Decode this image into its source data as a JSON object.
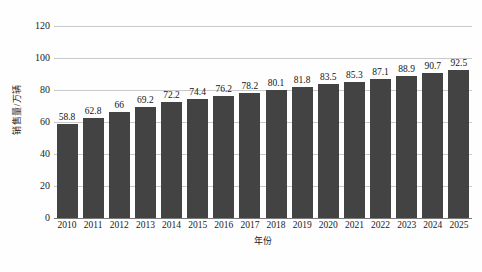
{
  "chart_data": {
    "type": "bar",
    "title": "",
    "subtitle": "",
    "xlabel": "年份",
    "ylabel": "销售量/万辆",
    "categories": [
      "2010",
      "2011",
      "2012",
      "2013",
      "2014",
      "2015",
      "2016",
      "2017",
      "2018",
      "2019",
      "2020",
      "2021",
      "2022",
      "2023",
      "2024",
      "2025"
    ],
    "values": [
      58.8,
      62.8,
      66,
      69.2,
      72.2,
      74.4,
      76.2,
      78.2,
      80.1,
      81.8,
      83.5,
      85.3,
      87.1,
      88.9,
      90.7,
      92.5
    ],
    "value_labels": [
      "58.8",
      "62.8",
      "66",
      "69.2",
      "72.2",
      "74.4",
      "76.2",
      "78.2",
      "80.1",
      "81.8",
      "83.5",
      "85.3",
      "87.1",
      "88.9",
      "90.7",
      "92.5"
    ],
    "ylim": [
      0,
      120
    ],
    "yticks": [
      0,
      20,
      40,
      60,
      80,
      100,
      120
    ],
    "ytick_labels": [
      "0",
      "20",
      "40",
      "60",
      "80",
      "100",
      "120"
    ],
    "grid": true,
    "grid_axis": "y",
    "legend": false,
    "legend_position": "none",
    "bar_color": "#434343",
    "gridline_color": "#c9c9c9",
    "axis_color": "#7a7a7a",
    "background_color": "#fefefe",
    "data_labels_shown": true
  }
}
